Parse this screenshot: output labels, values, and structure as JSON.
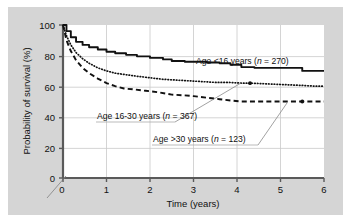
{
  "figure": {
    "background_color": "#d5d5d5",
    "plot_background_color": "#ffffff",
    "border_color": "#ffffff"
  },
  "chart_data": {
    "type": "line",
    "title": "",
    "subtitle": "",
    "xlabel": "Time (years)",
    "ylabel": "Probability of survival (%)",
    "xlim": [
      0,
      6
    ],
    "ylim": [
      0,
      100
    ],
    "xticks": [
      "0",
      "1",
      "2",
      "3",
      "4",
      "5",
      "6"
    ],
    "yticks": [
      "0",
      "20",
      "40",
      "60",
      "80",
      "100"
    ],
    "grid": true,
    "grid_color": "#c9c9c9",
    "legend_position": "inline-annotations",
    "axis_break": true,
    "series": [
      {
        "name": "Age <16 years (n = 270)",
        "group": "Age <16 years",
        "n": 270,
        "style": "solid",
        "color": "#111111",
        "x": [
          0,
          0.08,
          0.18,
          0.3,
          0.45,
          0.6,
          0.8,
          1.0,
          1.2,
          1.45,
          1.7,
          2.0,
          2.3,
          2.5,
          2.8,
          3.0,
          3.3,
          3.6,
          3.85,
          4.1,
          4.4,
          4.8,
          5.2,
          5.5,
          5.75,
          6.0
        ],
        "y": [
          100,
          96,
          92,
          89,
          87,
          85.5,
          84,
          82.5,
          81.5,
          80.5,
          79.5,
          78.5,
          77.5,
          76.5,
          76,
          76,
          75.5,
          75,
          74,
          72.5,
          72,
          72,
          72,
          70,
          70,
          70
        ],
        "final_value": 70
      },
      {
        "name": "Age 16-30 years (n = 367)",
        "group": "Age 16-30 years",
        "n": 367,
        "style": "dotted",
        "color": "#111111",
        "x": [
          0,
          0.08,
          0.18,
          0.3,
          0.45,
          0.6,
          0.8,
          1.0,
          1.2,
          1.45,
          1.7,
          2.0,
          2.3,
          2.6,
          2.9,
          3.2,
          3.5,
          3.8,
          4.1,
          4.3,
          4.7,
          5.1,
          5.5,
          5.8,
          6.0
        ],
        "y": [
          100,
          93,
          87,
          82,
          78,
          75,
          72,
          70,
          68.5,
          67.5,
          66.5,
          65.5,
          64.5,
          64,
          63.5,
          63,
          62.5,
          62.5,
          62,
          62,
          61.5,
          61,
          60.5,
          60,
          60
        ],
        "final_value": 60,
        "marker_point": {
          "x": 4.3,
          "y": 62
        }
      },
      {
        "name": "Age >30 years (n = 123)",
        "group": "Age >30 years",
        "n": 123,
        "style": "dashed",
        "color": "#111111",
        "x": [
          0,
          0.08,
          0.18,
          0.3,
          0.45,
          0.6,
          0.8,
          1.0,
          1.2,
          1.4,
          1.6,
          1.9,
          2.2,
          2.5,
          2.8,
          3.0,
          3.3,
          3.6,
          3.9,
          4.1,
          4.5,
          5.0,
          5.5,
          6.0
        ],
        "y": [
          100,
          90,
          83,
          77,
          72,
          68.5,
          65,
          62,
          60,
          58.5,
          58,
          57,
          56,
          54.5,
          54,
          53.5,
          52.5,
          51.5,
          50.5,
          50,
          50,
          50,
          50,
          50
        ],
        "final_value": 50,
        "marker_point": {
          "x": 5.5,
          "y": 50
        }
      }
    ],
    "annotations": [
      {
        "id": "label-age-under-16",
        "text_plain": "Age <16 years (",
        "text_italic": "n",
        "text_tail": " = 270)",
        "full_text": "Age <16 years (n = 270)",
        "anchor_x": 4.3,
        "anchor_y": 83
      },
      {
        "id": "label-age-16-30",
        "text_plain": "Age 16-30 years (",
        "text_italic": "n",
        "text_tail": " = 367)",
        "full_text": "Age 16-30 years (n = 367)",
        "anchor_x": 1.1,
        "anchor_y": 38
      },
      {
        "id": "label-age-over-30",
        "text_plain": "Age >30 years (",
        "text_italic": "n",
        "text_tail": " = 123)",
        "full_text": "Age >30 years (n = 123)",
        "anchor_x": 2.3,
        "anchor_y": 22
      }
    ]
  }
}
